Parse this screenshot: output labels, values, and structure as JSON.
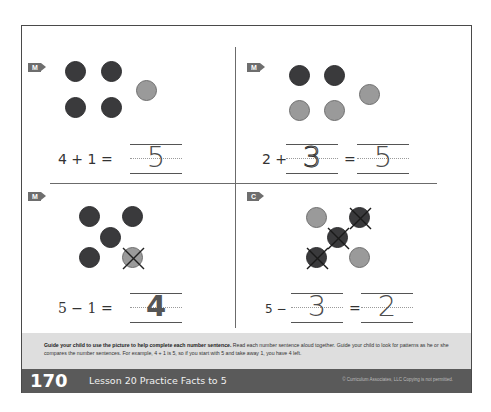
{
  "page": {
    "page_number": "170",
    "lesson_title": "Lesson 20 Practice Facts to 5",
    "copyright": "© Curriculum Associates, LLC  Copying is not permitted."
  },
  "instructions": {
    "bold": "Guide your child to use the picture to help complete each number sentence.",
    "body": " Read each number sentence aloud together. Guide your child to look for patterns as he or she compares the number sentences. For example, 4 + 1 is 5, so if you start with 5 and take away 1, you have 4 left."
  },
  "colors": {
    "dark_counter": "#3a3a3c",
    "light_counter": "#9a9a9a",
    "band": "#dedede",
    "footer": "#5a5a5a",
    "badge": "#6e6e6e"
  },
  "problems": [
    {
      "badge": "M",
      "counters": [
        "dark",
        "dark",
        "dark",
        "dark",
        "light"
      ],
      "crossed": [],
      "equation": {
        "left": "4 + 1 =",
        "answer": "5"
      }
    },
    {
      "badge": "M",
      "counters": [
        "dark",
        "dark",
        "light",
        "light",
        "light"
      ],
      "crossed": [],
      "equation": {
        "left": "2 +",
        "blank": "3",
        "equals": "=",
        "answer": "5"
      }
    },
    {
      "badge": "M",
      "counters": [
        "dark",
        "dark",
        "dark",
        "dark",
        "light"
      ],
      "crossed": [
        4
      ],
      "equation": {
        "left": "5 − 1 =",
        "answer": "4"
      }
    },
    {
      "badge": "C",
      "counters": [
        "light",
        "dark",
        "dark",
        "dark",
        "light"
      ],
      "crossed": [
        1,
        2,
        3
      ],
      "equation": {
        "left": "5 −",
        "blank": "3",
        "equals": "=",
        "answer": "2"
      }
    }
  ]
}
